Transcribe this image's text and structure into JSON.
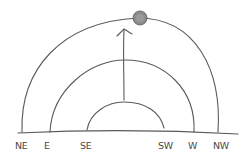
{
  "diagram": {
    "direction_labels": [
      "NE",
      "E",
      "SE",
      "SW",
      "W",
      "NW"
    ],
    "arcs": [
      {
        "name": "summer-path",
        "from": "NE",
        "to": "NW"
      },
      {
        "name": "equinox-path",
        "from": "E",
        "to": "W"
      },
      {
        "name": "winter-path",
        "from": "SE",
        "to": "SW"
      }
    ],
    "sun": {
      "on_arc": "summer-path",
      "position": "zenith"
    },
    "arrow": {
      "from": "winter-path",
      "to": "summer-path",
      "direction": "up"
    },
    "colors": {
      "line": "#5a5a5a",
      "sun_fill": "#8c8c8c",
      "label": "#4a4a4a"
    }
  }
}
